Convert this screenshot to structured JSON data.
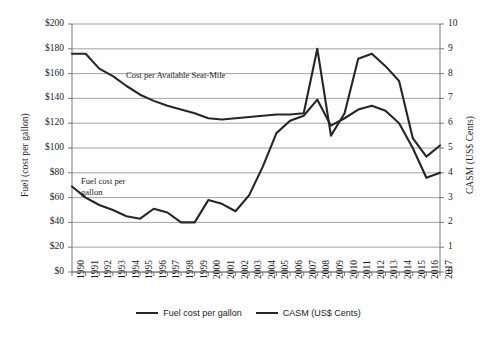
{
  "chart_data": {
    "type": "line",
    "title": "",
    "xlabel": "",
    "ylabel": "Fuel (cost per gallon)",
    "y2label": "CASM (US$ Cents)",
    "grid": true,
    "legend_position": "bottom",
    "x": [
      1990,
      1991,
      1992,
      1993,
      1994,
      1995,
      1996,
      1997,
      1998,
      1999,
      2000,
      2001,
      2002,
      2003,
      2004,
      2005,
      2006,
      2007,
      2008,
      2009,
      2010,
      2011,
      2012,
      2013,
      2014,
      2015,
      2016,
      2017
    ],
    "categories": [
      "1990",
      "1991",
      "1992",
      "1993",
      "1994",
      "1995",
      "1996",
      "1997",
      "1998",
      "1999",
      "2000",
      "2001",
      "2002",
      "2003",
      "2004",
      "2005",
      "2006",
      "2007",
      "2008",
      "2009",
      "2010",
      "2011",
      "2012",
      "2013",
      "2014",
      "2015",
      "2016",
      "2017"
    ],
    "ylim": [
      0,
      200
    ],
    "y2lim": [
      0,
      10
    ],
    "yticks": [
      "$0",
      "$20",
      "$40",
      "$60",
      "$80",
      "$100",
      "$120",
      "$140",
      "$160",
      "$180",
      "$200"
    ],
    "ytick_values": [
      0,
      20,
      40,
      60,
      80,
      100,
      120,
      140,
      160,
      180,
      200
    ],
    "y2ticks": [
      "0",
      "1",
      "2",
      "3",
      "4",
      "5",
      "6",
      "7",
      "8",
      "9",
      "10"
    ],
    "y2tick_values": [
      0,
      1,
      2,
      3,
      4,
      5,
      6,
      7,
      8,
      9,
      10
    ],
    "series": [
      {
        "name": "Fuel cost per gallon",
        "axis": "left",
        "color": "#262626",
        "values": [
          69,
          60,
          54,
          50,
          45,
          43,
          51,
          48,
          40,
          40,
          58,
          55,
          49,
          62,
          85,
          112,
          122,
          126,
          139,
          118,
          124,
          131,
          134,
          130,
          120,
          100,
          76,
          80
        ]
      },
      {
        "name": "CASM (US$ Cents)",
        "axis": "right",
        "color": "#262626",
        "values": [
          8.8,
          8.8,
          8.2,
          7.9,
          7.5,
          7.15,
          6.9,
          6.7,
          6.55,
          6.4,
          6.2,
          6.15,
          6.2,
          6.25,
          6.3,
          6.35,
          6.35,
          6.4,
          9.0,
          5.5,
          6.4,
          8.6,
          8.8,
          8.3,
          7.7,
          5.4,
          4.65,
          5.1
        ]
      }
    ],
    "annotations": [
      {
        "text": "Cost per Available Seat-Mile",
        "x_px": 126,
        "y_px": 70
      },
      {
        "text": "Fuel cost per\ngallon",
        "x_px": 81,
        "y_px": 176
      }
    ]
  },
  "legend": {
    "items": [
      {
        "label": "Fuel cost per gallon"
      },
      {
        "label": "CASM (US$ Cents)"
      }
    ]
  }
}
